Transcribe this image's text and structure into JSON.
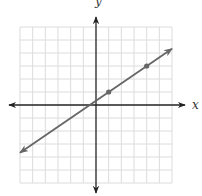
{
  "chart_data": {
    "type": "line",
    "title": "",
    "xlabel": "x",
    "ylabel": "y",
    "xlim": [
      -6,
      6
    ],
    "ylim": [
      -6,
      6
    ],
    "grid": true,
    "grid_step": 1,
    "tick_labels": false,
    "series": [
      {
        "name": "line",
        "equation": "y = (2/3)x + 1/3",
        "slope": 0.6667,
        "intercept": 0.3333,
        "marked_points": [
          {
            "x": 1,
            "y": 1
          },
          {
            "x": 4,
            "y": 3
          }
        ],
        "extends_both_ways": true,
        "x_range_drawn": [
          -6,
          6
        ]
      }
    ]
  },
  "colors": {
    "axis": "#222222",
    "grid": "#dcdcdc",
    "line": "#666666",
    "point": "#666666"
  },
  "labels": {
    "x_axis": "x",
    "y_axis": "y"
  }
}
